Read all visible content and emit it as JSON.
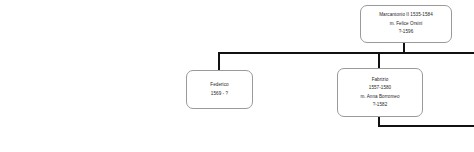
{
  "diagram": {
    "nodes": [
      {
        "id": "marcantonio",
        "name": "Marcantonio II 1535-1584",
        "spouse": "m. Felice Orsini",
        "dates": "?-1596"
      },
      {
        "id": "federico",
        "name": "Federico",
        "dates": "1569 - ?"
      },
      {
        "id": "fabrizio",
        "name": "Fabrizio",
        "dates": "1557-1580",
        "spouse": "m. Anna Borromeo",
        "spouse_dates": "?-1582"
      }
    ],
    "colors": {
      "box_border": "#9a9a9a",
      "box_fill": "#ffffff",
      "connector": "#111111",
      "text": "#262626",
      "background": "#ffffff"
    }
  }
}
